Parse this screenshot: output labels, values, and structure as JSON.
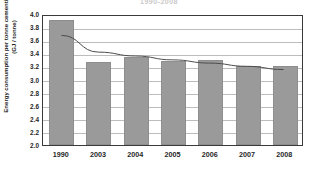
{
  "chart_data": {
    "type": "bar",
    "title": "1990-2008",
    "xlabel": "",
    "ylabel": "Energy consumption per tonne cementitious product (GJ / tonne)",
    "categories": [
      "1990",
      "2003",
      "2004",
      "2005",
      "2006",
      "2007",
      "2008"
    ],
    "values": [
      3.91,
      3.27,
      3.35,
      3.29,
      3.3,
      3.2,
      3.21
    ],
    "series": [
      {
        "name": "Energy consumption per tonne cementitious product",
        "type": "bar",
        "values": [
          3.91,
          3.27,
          3.35,
          3.29,
          3.3,
          3.2,
          3.21
        ]
      },
      {
        "name": "Trendline",
        "type": "line",
        "values": [
          3.7,
          3.44,
          3.38,
          3.32,
          3.27,
          3.22,
          3.17
        ]
      }
    ],
    "ylim": [
      2.0,
      4.0
    ],
    "ytick_values": [
      2.0,
      2.2,
      2.4,
      2.6,
      2.8,
      3.0,
      3.2,
      3.4,
      3.6,
      3.8,
      4.0
    ],
    "ytick_labels": [
      "2.0",
      "2.2",
      "2.4",
      "2.6",
      "2.8",
      "3.0",
      "3.2",
      "3.4",
      "3.6",
      "3.8",
      "4.0"
    ],
    "grid": true,
    "legend": "none",
    "bar_color": "#9a9a9a",
    "trendline_color": "#4a4a4a",
    "gridline_color": "#bdbdbd",
    "axis_color": "#3a3a3a"
  }
}
